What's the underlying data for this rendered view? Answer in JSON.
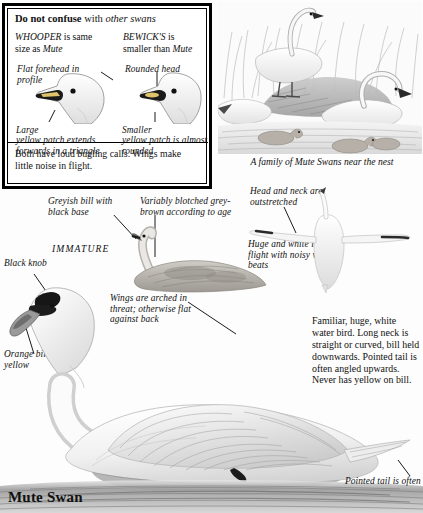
{
  "page": {
    "title": "Mute Swan",
    "background_color": "#fdfdfd",
    "ink_color": "#111111"
  },
  "compare_box": {
    "heading_bold": "Do not confuse",
    "heading_rest": "with",
    "heading_italic": "other swans",
    "left_column": {
      "line1_caps": "WHOOPER",
      "line1_rest": "is same",
      "line2_rest": "size as",
      "line2_italic": "Mute",
      "feature_label": "Flat forehead in profile",
      "patch_label_em": "Large",
      "patch_label": "yellow patch extends forwards in a triangle"
    },
    "right_column": {
      "line1_caps": "BEWICK'S",
      "line1_rest": "is",
      "line2_rest": "smaller than",
      "line2_italic": "Mute",
      "feature_label": "Rounded head",
      "patch_label_em": "Smaller",
      "patch_label": "yellow patch is almost rounded"
    },
    "footer": "Both have loud bugling calls. Wings make little noise in flight."
  },
  "nest_scene": {
    "caption": "A family of Mute Swans near the nest"
  },
  "immature": {
    "label": "IMMATURE",
    "bill_note": "Greyish bill with black base",
    "plumage_note": "Variably blotched grey-brown according to age"
  },
  "adult": {
    "knob_note": "Black knob",
    "bill_note": "Orange bill: no yellow",
    "wings_note": "Wings are arched in threat; otherwise flat against back",
    "sex_symbol": "♂",
    "tail_note": "Pointed tail is often"
  },
  "flight": {
    "neck_note": "Head and neck are outstretched",
    "flight_note": "Huge and white in flight with noisy wing-beats"
  },
  "description": {
    "text": "Familiar, huge, white water bird. Long neck is straight or curved, bill held downwards. Pointed tail is often angled upwards. Never has yellow on bill."
  }
}
